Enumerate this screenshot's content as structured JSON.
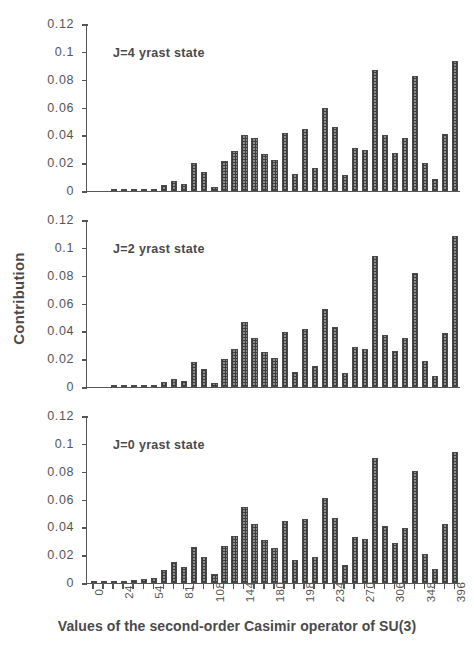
{
  "chart_data": {
    "type": "bar",
    "title": "",
    "xlabel": "Values of the second-order Casimir operator of SU(3)",
    "ylabel": "Contribution",
    "ylim": [
      0,
      0.12
    ],
    "ytick_labels": [
      "0.12",
      "0.1",
      "0.08",
      "0.06",
      "0.04",
      "0.02",
      "0"
    ],
    "ytick_values": [
      0.12,
      0.1,
      0.08,
      0.06,
      0.04,
      0.02,
      0
    ],
    "grid": false,
    "legend": "none",
    "n_bars": 49,
    "xtick_labels": [
      "0",
      "",
      "",
      "24",
      "",
      "",
      "54",
      "",
      "",
      "81",
      "",
      "",
      "108",
      "",
      "",
      "144",
      "",
      "",
      "180",
      "",
      "",
      "198",
      "",
      "",
      "234",
      "",
      "",
      "270",
      "",
      "",
      "306",
      "",
      "",
      "348",
      "",
      "",
      "396"
    ],
    "x_categories": [
      0,
      4,
      12,
      24,
      28,
      36,
      54,
      60,
      72,
      81,
      84,
      96,
      108,
      114,
      126,
      144,
      150,
      156,
      180,
      186,
      192,
      198,
      204,
      216,
      234,
      240,
      252,
      270,
      276,
      288,
      306,
      312,
      324,
      348,
      354,
      366,
      396
    ],
    "panels": [
      {
        "label": "J=4 yrast state",
        "series_name": "J=4",
        "values": [
          0.0,
          0.0,
          0.0008,
          0.001,
          0.0012,
          0.001,
          0.0015,
          0.004,
          0.0072,
          0.0048,
          0.0198,
          0.014,
          0.003,
          0.0215,
          0.029,
          0.04,
          0.038,
          0.0265,
          0.0222,
          0.042,
          0.0123,
          0.0445,
          0.0163,
          0.0598,
          0.0458,
          0.0112,
          0.031,
          0.0292,
          0.0873,
          0.04,
          0.0275,
          0.0378,
          0.0826,
          0.0198,
          0.0088,
          0.0412,
          0.0935
        ]
      },
      {
        "label": "J=2 yrast state",
        "series_name": "J=2",
        "values": [
          0.0,
          0.0,
          0.0006,
          0.0008,
          0.001,
          0.001,
          0.0013,
          0.0035,
          0.006,
          0.0042,
          0.018,
          0.013,
          0.0028,
          0.02,
          0.027,
          0.0465,
          0.0355,
          0.025,
          0.0205,
          0.0395,
          0.011,
          0.0415,
          0.015,
          0.056,
          0.043,
          0.01,
          0.029,
          0.0275,
          0.094,
          0.0375,
          0.0258,
          0.0355,
          0.0818,
          0.0185,
          0.008,
          0.0385,
          0.1088
        ]
      },
      {
        "label": "J=0 yrast state",
        "series_name": "J=0",
        "values": [
          0.001,
          0.0012,
          0.0015,
          0.0018,
          0.0022,
          0.0026,
          0.0038,
          0.009,
          0.015,
          0.0118,
          0.0262,
          0.019,
          0.0062,
          0.0265,
          0.034,
          0.0545,
          0.0422,
          0.031,
          0.025,
          0.0448,
          0.0162,
          0.046,
          0.0185,
          0.0612,
          0.047,
          0.0128,
          0.033,
          0.0318,
          0.0895,
          0.0408,
          0.0285,
          0.0395,
          0.0805,
          0.0205,
          0.0098,
          0.0422,
          0.0945
        ]
      }
    ]
  },
  "axis": {
    "ylabel": "Contribution",
    "xlabel": "Values of the second-order Casimir operator of SU(3)"
  }
}
